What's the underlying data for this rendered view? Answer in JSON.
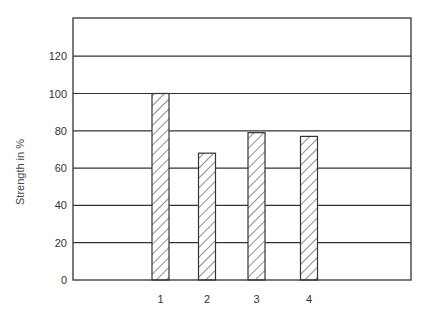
{
  "chart_data": {
    "type": "bar",
    "title": "",
    "xlabel": "",
    "ylabel": "Strength in %",
    "categories": [
      "1",
      "2",
      "3",
      "4"
    ],
    "values": [
      100,
      68,
      79,
      77
    ],
    "ylim": [
      0,
      140
    ],
    "yticks": [
      0,
      20,
      40,
      60,
      80,
      100,
      120
    ],
    "grid": true,
    "legend": null,
    "bar_fill": "diagonal-hatch",
    "colors": {
      "line": "#333333",
      "hatch": "#333333",
      "background": "#ffffff"
    }
  }
}
